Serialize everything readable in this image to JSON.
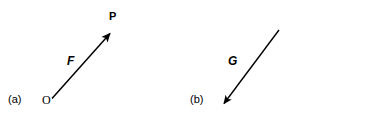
{
  "figure": {
    "background_color": "#ffffff",
    "stroke_color": "#000000",
    "width": 368,
    "height": 131
  },
  "panels": [
    {
      "tag": "(a)",
      "vector_label": "F",
      "tail_point_label": "O",
      "head_point_label": "P",
      "direction": "up-right",
      "arrow": {
        "tail_x": 52,
        "tail_y": 99,
        "tip_x": 115,
        "tip_y": 29
      }
    },
    {
      "tag": "(b)",
      "vector_label": "G",
      "tail_point_label": "",
      "head_point_label": "",
      "direction": "down-left",
      "arrow": {
        "tail_x": 279,
        "tail_y": 30,
        "tip_x": 219,
        "tip_y": 110
      }
    }
  ]
}
